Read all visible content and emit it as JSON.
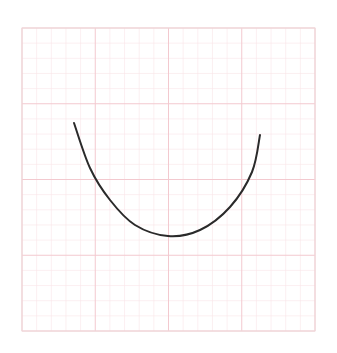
{
  "figure": {
    "background": "#ffffff",
    "grid": {
      "x": 22,
      "y": 28,
      "width": 293,
      "height": 303,
      "major_divisions_x": 4,
      "major_divisions_y": 4,
      "minor_per_major": 5,
      "major_color": "#f3c9cf",
      "minor_color": "#f8e4e7",
      "border_color": "#eed8da"
    },
    "curve": {
      "color": "#2a2a2a",
      "stroke_width": 2,
      "points": [
        [
          74,
          123
        ],
        [
          90,
          168
        ],
        [
          110,
          200
        ],
        [
          135,
          225
        ],
        [
          168,
          236
        ],
        [
          200,
          230
        ],
        [
          230,
          207
        ],
        [
          252,
          172
        ],
        [
          260,
          135
        ]
      ]
    }
  }
}
